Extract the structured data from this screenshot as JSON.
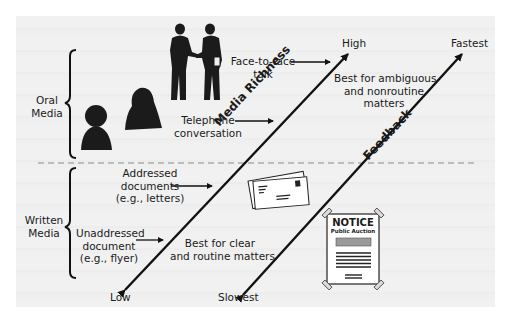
{
  "categories": {
    "oral": {
      "line1": "Oral",
      "line2": "Media"
    },
    "written": {
      "line1": "Written",
      "line2": "Media"
    }
  },
  "media": {
    "face_to_face": {
      "line1": "Face-to-face",
      "line2": "talk"
    },
    "telephone": {
      "line1": "Telephone",
      "line2": "conversation"
    },
    "addressed": {
      "line1": "Addressed",
      "line2": "documents",
      "line3": "(e.g., letters)"
    },
    "unaddressed": {
      "line1": "Unaddressed",
      "line2": "document",
      "line3": "(e.g., flyer)"
    }
  },
  "axes": {
    "media_richness": {
      "label": "Media Richness",
      "high": "High",
      "low": "Low"
    },
    "feedback": {
      "label": "Feedback",
      "high": "Fastest",
      "low": "Slowest"
    }
  },
  "notes": {
    "ambiguous": {
      "line1": "Best for ambiguous",
      "line2": "and nonroutine",
      "line3": "matters"
    },
    "routine": {
      "line1": "Best for clear",
      "line2": "and routine matters"
    }
  },
  "notice": {
    "title": "NOTICE",
    "subtitle": "Public Auction"
  }
}
